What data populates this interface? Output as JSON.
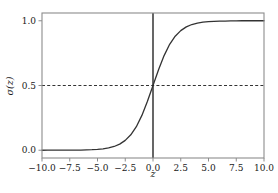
{
  "chart_data": {
    "type": "line",
    "title": "",
    "subtitle": "",
    "xlabel": "z",
    "ylabel": "σ(z)",
    "xlim": [
      -10.0,
      10.0
    ],
    "ylim": [
      -0.06,
      1.06
    ],
    "grid": false,
    "legend": null,
    "series": [
      {
        "name": "sigmoid",
        "formula": "1 / (1 + exp(-z))",
        "color": "#333333",
        "linewidth": 1.3,
        "x": [
          -10.0,
          -9.5,
          -9.0,
          -8.5,
          -8.0,
          -7.5,
          -7.0,
          -6.5,
          -6.0,
          -5.5,
          -5.0,
          -4.5,
          -4.0,
          -3.5,
          -3.0,
          -2.5,
          -2.0,
          -1.5,
          -1.0,
          -0.5,
          0.0,
          0.5,
          1.0,
          1.5,
          2.0,
          2.5,
          3.0,
          3.5,
          4.0,
          4.5,
          5.0,
          5.5,
          6.0,
          6.5,
          7.0,
          7.5,
          8.0,
          8.5,
          9.0,
          9.5,
          10.0
        ],
        "y": [
          0.0,
          0.0001,
          0.0001,
          0.0002,
          0.0003,
          0.0006,
          0.0009,
          0.0015,
          0.0025,
          0.0041,
          0.0067,
          0.011,
          0.018,
          0.029,
          0.047,
          0.076,
          0.119,
          0.182,
          0.269,
          0.378,
          0.5,
          0.622,
          0.731,
          0.818,
          0.881,
          0.924,
          0.953,
          0.971,
          0.982,
          0.989,
          0.993,
          0.996,
          0.998,
          0.998,
          0.999,
          0.999,
          1.0,
          1.0,
          1.0,
          1.0,
          1.0
        ]
      }
    ],
    "annotations": [
      {
        "name": "midpoint-hline",
        "kind": "hline",
        "value": 0.5,
        "style": "dashed",
        "color": "#333333"
      },
      {
        "name": "origin-vline",
        "kind": "vline",
        "value": 0.0,
        "style": "solid",
        "color": "#000000"
      }
    ],
    "xticks": [
      -10.0,
      -7.5,
      -5.0,
      -2.5,
      0.0,
      2.5,
      5.0,
      7.5,
      10.0
    ],
    "xtick_labels": [
      "-10.0",
      "-7.5",
      "-5.0",
      "-2.5",
      "0.0",
      "2.5",
      "5.0",
      "7.5",
      "10.0"
    ],
    "yticks": [
      0.0,
      0.5,
      1.0
    ],
    "ytick_labels": [
      "0.0",
      "0.5",
      "1.0"
    ],
    "colors": {
      "background": "#ffffff",
      "frame": "#8c8c8c",
      "curve": "#333333",
      "vline": "#111111",
      "hline": "#444444",
      "text": "#1a1a1a"
    }
  }
}
